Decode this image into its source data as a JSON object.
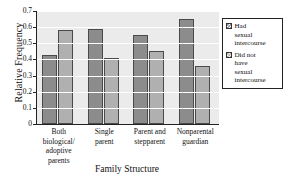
{
  "chart_data": {
    "type": "bar",
    "title": "",
    "xlabel": "Family Structure",
    "ylabel": "Relative Frequency",
    "ylim": [
      0,
      0.7
    ],
    "ytick_labels": [
      "0",
      "0.1",
      "0.2",
      "0.3",
      "0.4",
      "0.5",
      "0.6",
      "0.7"
    ],
    "ytick_values": [
      0,
      0.1,
      0.2,
      0.3,
      0.4,
      0.5,
      0.6,
      0.7
    ],
    "grid": true,
    "legend_position": "right",
    "categories": [
      "Both biological/ adoptive parents",
      "Single parent",
      "Parent and stepparent",
      "Nonparental guardian"
    ],
    "category_lines": [
      [
        "Both",
        "biological/",
        "adoptive",
        "parents"
      ],
      [
        "Single",
        "parent"
      ],
      [
        "Parent and",
        "stepparent"
      ],
      [
        "Nonparental",
        "guardian"
      ]
    ],
    "series": [
      {
        "name": "Had sexual intercourse",
        "name_lines": [
          "Had",
          "sexual",
          "intercourse"
        ],
        "color": "#8c8c8c",
        "values": [
          0.43,
          0.59,
          0.55,
          0.65
        ]
      },
      {
        "name": "Did not have sexual intercourse",
        "name_lines": [
          "Did not",
          "have",
          "sexual",
          "intercourse"
        ],
        "color": "#b0b0b0",
        "values": [
          0.58,
          0.41,
          0.45,
          0.36
        ]
      }
    ]
  },
  "colors": {
    "plot_background": "#ebebeb",
    "gridline": "#ffffff",
    "axis": "#222222",
    "bar_border": "#4a4a4a",
    "text": "#111111"
  }
}
